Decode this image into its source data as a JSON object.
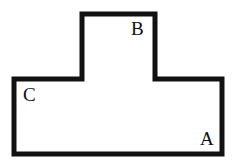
{
  "figure": {
    "name": "T-shaped polygon outline",
    "shape_type": "t-shape",
    "background_color": "#ffffff",
    "stroke_color": "#111111",
    "fill_color": "none",
    "stroke_width": 5,
    "canvas": {
      "width": 235,
      "height": 165
    },
    "outline_points": "82,14 155,14 155,79 222,79 222,154 14,154 14,79 82,79",
    "vertices": [
      {
        "id": "stem-top-left",
        "x": 82,
        "y": 14
      },
      {
        "id": "stem-top-right",
        "x": 155,
        "y": 14
      },
      {
        "id": "inner-corner-right",
        "x": 155,
        "y": 79
      },
      {
        "id": "arm-top-right",
        "x": 222,
        "y": 79
      },
      {
        "id": "bottom-right",
        "x": 222,
        "y": 154
      },
      {
        "id": "bottom-left",
        "x": 14,
        "y": 154
      },
      {
        "id": "arm-top-left",
        "x": 14,
        "y": 79
      },
      {
        "id": "inner-corner-left",
        "x": 82,
        "y": 79
      }
    ],
    "labels": [
      {
        "id": "B",
        "text": "B",
        "x": 131,
        "y": 19,
        "anchor": "stem top-right interior"
      },
      {
        "id": "C",
        "text": "C",
        "x": 23,
        "y": 85,
        "anchor": "left arm top-left interior"
      },
      {
        "id": "A",
        "text": "A",
        "x": 200,
        "y": 129,
        "anchor": "bottom-right interior"
      }
    ]
  }
}
